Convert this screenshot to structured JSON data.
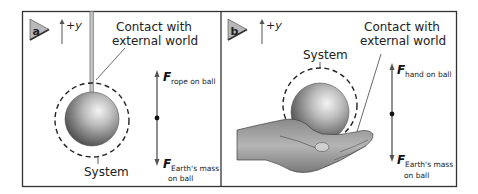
{
  "panels": [
    {
      "id": "a",
      "badge": "a",
      "axis_label": "+y",
      "contact_label_line1": "Contact with",
      "contact_label_line2": "external world",
      "system_label": "System",
      "force_up": {
        "symbol": "F",
        "subscript": "rope on ball"
      },
      "force_down": {
        "symbol": "F",
        "subscript_line1": "Earth's mass",
        "subscript_line2": "on ball"
      },
      "support": "rope"
    },
    {
      "id": "b",
      "badge": "b",
      "axis_label": "+y",
      "contact_label_line1": "Contact with",
      "contact_label_line2": "external world",
      "system_label": "System",
      "force_up": {
        "symbol": "F",
        "subscript": "hand on ball"
      },
      "force_down": {
        "symbol": "F",
        "subscript_line1": "Earth's mass",
        "subscript_line2": "on ball"
      },
      "support": "hand"
    }
  ],
  "colors": {
    "frame": "#333333",
    "badge_fill": "#b8b8b8",
    "rope": "#a8a8a8",
    "vector": "#555555",
    "dash": "#222222"
  }
}
